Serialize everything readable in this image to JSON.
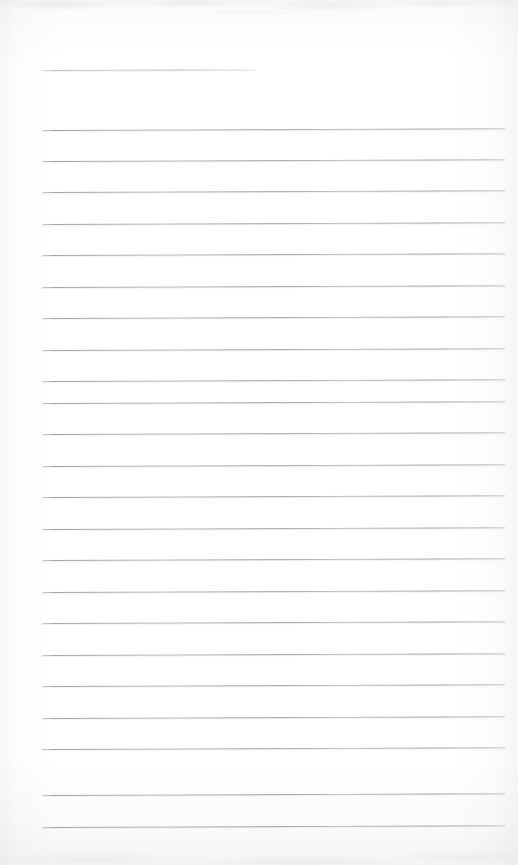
{
  "document": {
    "kind": "scanned-blank-lined-page",
    "title": "",
    "visible_text": "",
    "page_width": 518,
    "page_height": 865,
    "background_color": "#fdfdfd",
    "rule_color": "#9a9da3",
    "rule_thickness_px": 1,
    "skew_degrees": -0.22,
    "content_note": "No handwriting, no printed text, no headings — the page is blank apart from the ruling."
  },
  "ruling": {
    "left_margin_x": 42,
    "right_margin_x": 505,
    "line_spacing_px": 31.5,
    "header_rule": {
      "label": "header-rule",
      "y": 70,
      "x_start": 42,
      "x_end": 256,
      "width": 214
    },
    "body_rules": [
      {
        "label": "rule-1",
        "y": 130,
        "x_start": 42,
        "x_end": 505
      },
      {
        "label": "rule-2",
        "y": 161,
        "x_start": 42,
        "x_end": 505
      },
      {
        "label": "rule-3",
        "y": 192,
        "x_start": 42,
        "x_end": 505
      },
      {
        "label": "rule-4",
        "y": 224,
        "x_start": 42,
        "x_end": 505
      },
      {
        "label": "rule-5",
        "y": 255,
        "x_start": 42,
        "x_end": 505
      },
      {
        "label": "rule-6",
        "y": 287,
        "x_start": 42,
        "x_end": 505
      },
      {
        "label": "rule-7",
        "y": 318,
        "x_start": 42,
        "x_end": 505
      },
      {
        "label": "rule-8",
        "y": 350,
        "x_start": 42,
        "x_end": 505
      },
      {
        "label": "rule-9",
        "y": 381,
        "x_start": 42,
        "x_end": 505
      },
      {
        "label": "rule-10",
        "y": 403,
        "x_start": 42,
        "x_end": 505
      },
      {
        "label": "rule-11",
        "y": 434,
        "x_start": 42,
        "x_end": 505
      },
      {
        "label": "rule-12",
        "y": 466,
        "x_start": 42,
        "x_end": 505
      },
      {
        "label": "rule-13",
        "y": 497,
        "x_start": 42,
        "x_end": 505
      },
      {
        "label": "rule-14",
        "y": 529,
        "x_start": 42,
        "x_end": 505
      },
      {
        "label": "rule-15",
        "y": 560,
        "x_start": 42,
        "x_end": 505
      },
      {
        "label": "rule-16",
        "y": 592,
        "x_start": 42,
        "x_end": 505
      },
      {
        "label": "rule-17",
        "y": 623,
        "x_start": 42,
        "x_end": 505
      },
      {
        "label": "rule-18",
        "y": 655,
        "x_start": 42,
        "x_end": 505
      },
      {
        "label": "rule-19",
        "y": 686,
        "x_start": 42,
        "x_end": 505
      },
      {
        "label": "rule-20",
        "y": 718,
        "x_start": 42,
        "x_end": 505
      },
      {
        "label": "rule-21",
        "y": 749,
        "x_start": 42,
        "x_end": 505
      },
      {
        "label": "rule-22",
        "y": 795,
        "x_start": 42,
        "x_end": 505
      },
      {
        "label": "rule-23",
        "y": 827,
        "x_start": 42,
        "x_end": 505
      }
    ]
  }
}
